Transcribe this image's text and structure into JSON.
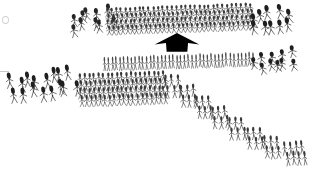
{
  "diagram": {
    "kind": "military order of battle schematic",
    "background_color": "#ffffff",
    "ink_color": "#1a1a1a",
    "width": 328,
    "height": 189
  },
  "arrow": {
    "label": "attack-direction-arrow",
    "direction": "up",
    "color": "#000000",
    "x": 154,
    "y": 33,
    "width": 46,
    "height": 19
  },
  "formations": [
    {
      "id": "top-left-cavalry",
      "label": "Left wing cavalry (upper line)",
      "type": "cavalry",
      "x": 68,
      "y": 11,
      "width": 44,
      "height": 22,
      "rows": 2,
      "cols": 5,
      "slant": -9,
      "density": "loose",
      "ink": "#262626"
    },
    {
      "id": "top-center-infantry",
      "label": "Center infantry line (upper line)",
      "type": "infantry",
      "x": 105,
      "y": 7,
      "width": 148,
      "height": 26,
      "rows": 4,
      "cols": 32,
      "slant": -2,
      "density": "dense",
      "ink": "#3a3a3a"
    },
    {
      "id": "top-right-cavalry",
      "label": "Right wing cavalry (upper line)",
      "type": "cavalry",
      "x": 246,
      "y": 10,
      "width": 46,
      "height": 24,
      "rows": 2,
      "cols": 5,
      "slant": -8,
      "density": "loose",
      "ink": "#1f1f1f"
    },
    {
      "id": "mid-center-infantry",
      "label": "Second line skirmishers",
      "type": "infantry",
      "x": 103,
      "y": 56,
      "width": 152,
      "height": 12,
      "rows": 1,
      "cols": 40,
      "slant": -2,
      "density": "thin",
      "ink": "#4a4a4a"
    },
    {
      "id": "mid-right-cavalry",
      "label": "Right wing cavalry (second line)",
      "type": "cavalry",
      "x": 252,
      "y": 53,
      "width": 44,
      "height": 20,
      "rows": 2,
      "cols": 5,
      "slant": -9,
      "density": "loose",
      "ink": "#1f1f1f"
    },
    {
      "id": "bottom-left-cavalry",
      "label": "Left wing cavalry (lower line)",
      "type": "cavalry",
      "x": 8,
      "y": 74,
      "width": 68,
      "height": 26,
      "rows": 2,
      "cols": 8,
      "slant": -7,
      "density": "loose",
      "ink": "#1f1f1f"
    },
    {
      "id": "bottom-center-infantry",
      "label": "Main infantry block (lower line)",
      "type": "infantry",
      "x": 78,
      "y": 74,
      "width": 88,
      "height": 32,
      "rows": 4,
      "cols": 19,
      "slant": -2,
      "density": "dense",
      "ink": "#3a3a3a"
    },
    {
      "id": "echelon-1",
      "label": "Echelon detachment 1",
      "type": "infantry",
      "x": 163,
      "y": 76,
      "width": 18,
      "height": 22,
      "rows": 2,
      "cols": 3,
      "slant": -3,
      "density": "medium",
      "ink": "#3a3a3a"
    },
    {
      "id": "echelon-2",
      "label": "Echelon detachment 2",
      "type": "infantry",
      "x": 178,
      "y": 86,
      "width": 18,
      "height": 22,
      "rows": 2,
      "cols": 3,
      "slant": -3,
      "density": "medium",
      "ink": "#3a3a3a"
    },
    {
      "id": "echelon-3",
      "label": "Echelon detachment 3",
      "type": "infantry",
      "x": 194,
      "y": 97,
      "width": 18,
      "height": 22,
      "rows": 2,
      "cols": 3,
      "slant": -3,
      "density": "medium",
      "ink": "#3a3a3a"
    },
    {
      "id": "echelon-4",
      "label": "Echelon detachment 4",
      "type": "infantry",
      "x": 210,
      "y": 107,
      "width": 18,
      "height": 22,
      "rows": 2,
      "cols": 3,
      "slant": -3,
      "density": "medium",
      "ink": "#3a3a3a"
    },
    {
      "id": "echelon-5",
      "label": "Echelon detachment 5",
      "type": "infantry",
      "x": 227,
      "y": 118,
      "width": 18,
      "height": 22,
      "rows": 2,
      "cols": 3,
      "slant": -3,
      "density": "medium",
      "ink": "#3a3a3a"
    },
    {
      "id": "echelon-6",
      "label": "Echelon detachment 6",
      "type": "infantry",
      "x": 245,
      "y": 128,
      "width": 18,
      "height": 22,
      "rows": 2,
      "cols": 3,
      "slant": -3,
      "density": "medium",
      "ink": "#3a3a3a"
    },
    {
      "id": "echelon-7",
      "label": "Echelon detachment 7",
      "type": "infantry",
      "x": 262,
      "y": 137,
      "width": 18,
      "height": 22,
      "rows": 2,
      "cols": 3,
      "slant": -3,
      "density": "medium",
      "ink": "#3a3a3a"
    },
    {
      "id": "echelon-8",
      "label": "Echelon detachment 8 (flank end)",
      "type": "infantry",
      "x": 283,
      "y": 142,
      "width": 22,
      "height": 24,
      "rows": 2,
      "cols": 4,
      "slant": -6,
      "density": "medium",
      "ink": "#3a3a3a"
    }
  ],
  "artifacts": [
    {
      "id": "edge-blob",
      "x": 2,
      "y": 16,
      "width": 5,
      "height": 6,
      "shape": "blob"
    },
    {
      "id": "edge-dash",
      "x": 0,
      "y": 71,
      "width": 9,
      "height": 1,
      "shape": "dash"
    }
  ]
}
